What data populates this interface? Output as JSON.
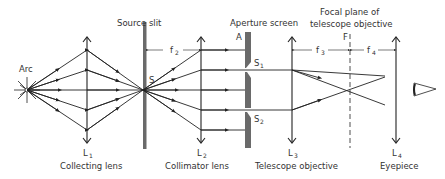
{
  "diagram": {
    "type": "optical-setup",
    "colors": {
      "line": "#222222",
      "screen": "#6a6a6a",
      "background": "#ffffff"
    },
    "components": {
      "arc": {
        "label": "Arc"
      },
      "l1": {
        "symbol": "L",
        "sub": "1",
        "caption": "Collecting lens"
      },
      "source_slit": {
        "caption": "Source slit",
        "point_label": "S"
      },
      "l2": {
        "symbol": "L",
        "sub": "2",
        "caption": "Collimator lens"
      },
      "aperture": {
        "caption": "Aperture screen",
        "edge_label": "A",
        "s1": "S",
        "s1_sub": "1",
        "s2": "S",
        "s2_sub": "2"
      },
      "l3": {
        "symbol": "L",
        "sub": "3",
        "caption": "Telescope objective"
      },
      "focal_plane": {
        "caption_line1": "Focal plane of",
        "caption_line2": "telescope objective",
        "label": "F"
      },
      "l4": {
        "symbol": "L",
        "sub": "4",
        "caption": "Eyepiece"
      },
      "eye": {
        "label": "eye-icon"
      }
    },
    "dimensions": {
      "f2": {
        "symbol": "f",
        "sub": "2"
      },
      "f3": {
        "symbol": "f",
        "sub": "3"
      },
      "f4": {
        "symbol": "f",
        "sub": "4"
      }
    }
  }
}
